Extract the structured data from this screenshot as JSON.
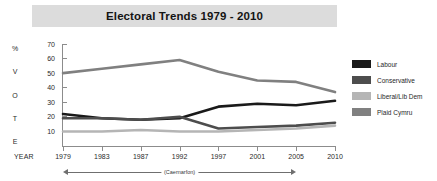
{
  "chart": {
    "title": "Electoral Trends 1979 - 2010",
    "vertical_axis_caption": [
      "%",
      "V",
      "O",
      "T",
      "E"
    ],
    "year_caption": "YEAR",
    "span_annotation": "(Caernarfon)"
  },
  "legend": {
    "items": [
      {
        "label": "Labour",
        "color": "#1a1a1a"
      },
      {
        "label": "Conservative",
        "color": "#4d4d4d"
      },
      {
        "label": "Liberal/Lib Dem",
        "color": "#b5b5b5"
      },
      {
        "label": "Plaid Cymru",
        "color": "#808080"
      }
    ]
  },
  "chart_data": {
    "type": "line",
    "title": "Electoral Trends 1979 - 2010",
    "xlabel": "YEAR",
    "ylabel": "% VOTE",
    "categories": [
      "1979",
      "1983",
      "1987",
      "1992",
      "1997",
      "2001",
      "2005",
      "2010"
    ],
    "yticks": [
      10,
      20,
      30,
      40,
      50,
      60,
      70
    ],
    "ylim": [
      0,
      70
    ],
    "grid": false,
    "legend_position": "right",
    "annotations": [
      "(Caernarfon)"
    ],
    "series": [
      {
        "name": "Labour",
        "color": "#1a1a1a",
        "values": [
          22,
          19,
          18,
          19,
          27,
          29,
          28,
          31
        ]
      },
      {
        "name": "Conservative",
        "color": "#4d4d4d",
        "values": [
          19,
          19,
          18,
          20,
          12,
          13,
          14,
          16
        ]
      },
      {
        "name": "Liberal/Lib Dem",
        "color": "#b5b5b5",
        "values": [
          10,
          10,
          11,
          10,
          10,
          11,
          12,
          14
        ]
      },
      {
        "name": "Plaid Cymru",
        "color": "#808080",
        "values": [
          50,
          53,
          56,
          59,
          51,
          45,
          44,
          37
        ]
      }
    ]
  }
}
